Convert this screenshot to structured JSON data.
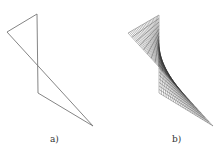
{
  "figures": [
    {
      "id": "a",
      "label": "a)",
      "description": "skew quadrilateral outline",
      "vertices": [
        [
          37,
          14
        ],
        [
          7,
          32
        ],
        [
          93,
          126
        ],
        [
          38,
          93
        ]
      ],
      "stroke": "#777777"
    },
    {
      "id": "b",
      "label": "b)",
      "description": "ruled surface (hyperbolic paraboloid) spanned by the quadrilateral",
      "vertices": [
        [
          159,
          15
        ],
        [
          128,
          33
        ],
        [
          213,
          126
        ],
        [
          159,
          93
        ]
      ],
      "stroke": "#333333",
      "rulings": 22
    }
  ],
  "colors": {
    "background": "#ffffff",
    "line_a": "#777777",
    "mesh_b": "#333333",
    "label": "#333333"
  }
}
